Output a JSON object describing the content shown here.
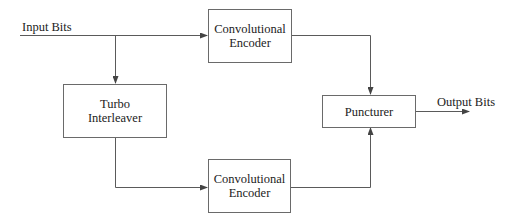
{
  "diagram": {
    "inputs": {
      "label": "Input Bits"
    },
    "outputs": {
      "label": "Output Bits"
    },
    "blocks": {
      "encoder_top": {
        "line1": "Convolutional",
        "line2": "Encoder"
      },
      "interleaver": {
        "line1": "Turbo",
        "line2": "Interleaver"
      },
      "encoder_bottom": {
        "line1": "Convolutional",
        "line2": "Encoder"
      },
      "puncturer": {
        "line1": "Puncturer"
      }
    },
    "connections": [
      {
        "from": "Input Bits",
        "to": "Convolutional Encoder (top)"
      },
      {
        "from": "Input Bits",
        "to": "Turbo Interleaver"
      },
      {
        "from": "Turbo Interleaver",
        "to": "Convolutional Encoder (bottom)"
      },
      {
        "from": "Convolutional Encoder (top)",
        "to": "Puncturer"
      },
      {
        "from": "Convolutional Encoder (bottom)",
        "to": "Puncturer"
      },
      {
        "from": "Puncturer",
        "to": "Output Bits"
      }
    ],
    "colors": {
      "line": "#5a5a5a",
      "text": "#222222",
      "background": "#ffffff"
    }
  }
}
